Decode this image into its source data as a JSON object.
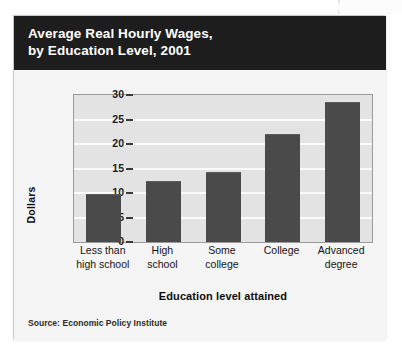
{
  "figure": {
    "title_line_1": "Average Real Hourly Wages,",
    "title_line_2": "by Education Level, 2001",
    "source": "Source: Economic Policy Institute",
    "colors": {
      "title_band": "#1d1d1d",
      "title_text": "#ffffff",
      "plot_background": "#e3e3e3",
      "gridline": "#fbfbfb",
      "bar": "#4a4a4a",
      "card_background": "#f4f4f4",
      "axis": "#3a3a3a"
    }
  },
  "chart_data": {
    "type": "bar",
    "title": "Average Real Hourly Wages, by Education Level, 2001",
    "subtitle": "",
    "categories": [
      "Less than high school",
      "High school",
      "Some college",
      "College",
      "Advanced degree"
    ],
    "category_label_lines": [
      [
        "Less than",
        "high school"
      ],
      [
        "High",
        "school"
      ],
      [
        "Some",
        "college"
      ],
      [
        "College",
        ""
      ],
      [
        "Advanced",
        "degree"
      ]
    ],
    "values": [
      9.7,
      12.4,
      14.3,
      22.0,
      28.6
    ],
    "xlabel": "Education level attained",
    "ylabel": "Dollars",
    "ylim": [
      0,
      30
    ],
    "yticks": [
      0,
      5,
      10,
      15,
      20,
      25,
      30
    ],
    "ytick_labels": [
      "0",
      "5",
      "10",
      "15",
      "20",
      "25",
      "30"
    ],
    "grid": true,
    "grid_axis": "y",
    "legend": false,
    "legend_position": "none",
    "annotations": [
      "Source: Economic Policy Institute"
    ]
  }
}
